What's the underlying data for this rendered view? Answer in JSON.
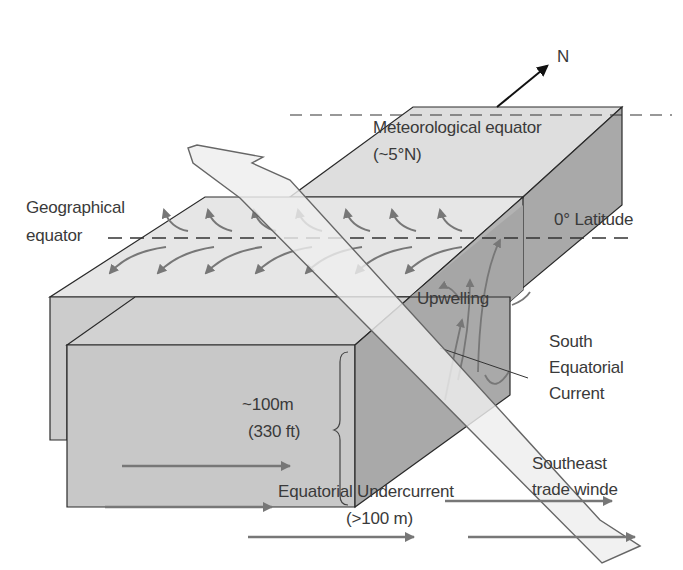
{
  "diagram": {
    "compass": {
      "label": "N"
    },
    "labels": {
      "meteorological_equator": "Meteorological equator",
      "meteorological_equator_lat": "(~5°N)",
      "geographical_equator_line1": "Geographical",
      "geographical_equator_line2": "equator",
      "zero_latitude": "0° Latitude",
      "upwelling": "Upwelling",
      "south_equatorial_current_line1": "South",
      "south_equatorial_current_line2": "Equatorial",
      "south_equatorial_current_line3": "Current",
      "depth_line1": "~100m",
      "depth_line2": "(330 ft)",
      "southeast_trade_winds_line1": "Southeast",
      "southeast_trade_winds_line2": "trade winde",
      "undercurrent_line1": "Equatorial Undercurrent",
      "undercurrent_line2": "(>100 m)"
    },
    "colors": {
      "top_face": "#e4e4e4",
      "front_face": "#c9c9c9",
      "side_face": "#ababab",
      "wind_band": "#ececec",
      "arrow_gray": "#777777",
      "text": "#3a3a3a",
      "outline": "#2a2a2a"
    }
  }
}
